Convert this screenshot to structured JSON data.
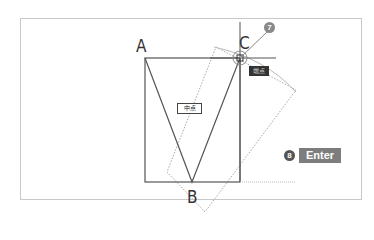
{
  "diagram": {
    "points": {
      "a": "A",
      "b": "B",
      "c": "C"
    },
    "steps": {
      "step7": "7",
      "step8": "8"
    },
    "action_key": "Enter",
    "labels": {
      "near_c": "端点",
      "center": "中点"
    },
    "colors": {
      "line": "#555555",
      "badge": "#777777",
      "key_bg": "#7d7d7d",
      "dark_label": "#333333"
    }
  }
}
